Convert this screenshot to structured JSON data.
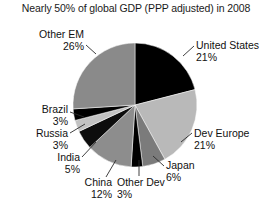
{
  "chart_data": {
    "type": "pie",
    "title": "Nearly 50% of global GDP (PPP adjusted) in 2008",
    "xlabel": "",
    "ylabel": "",
    "legend": "none",
    "grid": false,
    "start_angle_deg": 0,
    "direction": "clockwise",
    "categories": [
      "United States",
      "Dev Europe",
      "Japan",
      "Other Dev",
      "China",
      "India",
      "Russia",
      "Brazil",
      "Other EM"
    ],
    "values": [
      21,
      21,
      6,
      3,
      12,
      5,
      3,
      3,
      26
    ],
    "value_unit": "%",
    "slices": [
      {
        "label": "United States",
        "value": 21,
        "value_text": "21%",
        "color": "#000000"
      },
      {
        "label": "Dev Europe",
        "value": 21,
        "value_text": "21%",
        "color": "#b9b9b9"
      },
      {
        "label": "Japan",
        "value": 6,
        "value_text": "6%",
        "color": "#7b7b7b"
      },
      {
        "label": "Other Dev",
        "value": 3,
        "value_text": "3%",
        "color": "#000000"
      },
      {
        "label": "China",
        "value": 12,
        "value_text": "12%",
        "color": "#8d8d8d"
      },
      {
        "label": "India",
        "value": 5,
        "value_text": "5%",
        "color": "#0d0d0d"
      },
      {
        "label": "Russia",
        "value": 3,
        "value_text": "3%",
        "color": "#c2c2c2"
      },
      {
        "label": "Brazil",
        "value": 3,
        "value_text": "3%",
        "color": "#000000"
      },
      {
        "label": "Other EM",
        "value": 26,
        "value_text": "26%",
        "color": "#8a8a8a"
      }
    ]
  },
  "labels": {
    "other_em": {
      "name": "Other EM",
      "value": "26%"
    },
    "brazil": {
      "name": "Brazil",
      "value": "3%"
    },
    "russia": {
      "name": "Russia",
      "value": "3%"
    },
    "india": {
      "name": "India",
      "value": "5%"
    },
    "china": {
      "name": "China",
      "value": "12%"
    },
    "other_dev": {
      "name": "Other Dev",
      "value": "3%"
    },
    "japan": {
      "name": "Japan",
      "value": "6%"
    },
    "dev_europe": {
      "name": "Dev Europe",
      "value": "21%"
    },
    "united_states": {
      "name": "United States",
      "value": "21%"
    }
  },
  "colors": {
    "background": "#ffffff",
    "text": "#111111",
    "leader_line": "#2b2b2b"
  }
}
